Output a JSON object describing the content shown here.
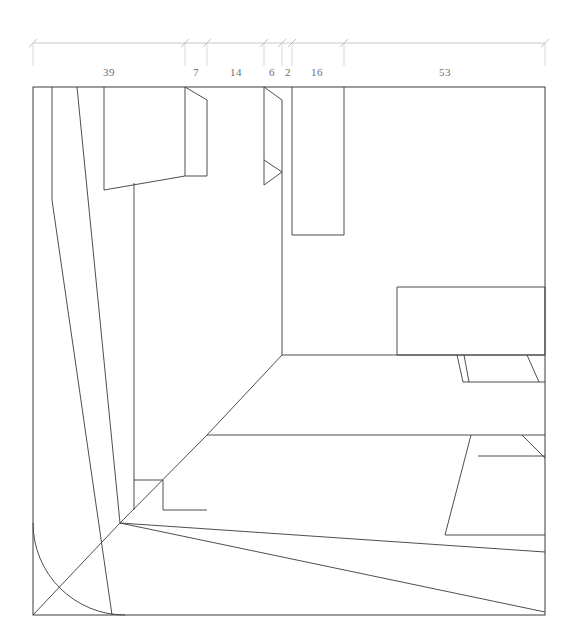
{
  "figure": {
    "background_color": "#ffffff",
    "line_color": "#3a3a3a",
    "dimension_color": "#b9b9b9",
    "dimension_text_color": "#6d6d6d"
  },
  "dimension_string": {
    "name": "top-dimension-chain",
    "baseline_y": 43,
    "label_y": 76,
    "start_x": 33,
    "end_x": 545,
    "ticks": [
      33,
      185,
      207,
      264,
      282,
      292,
      344,
      545
    ],
    "segments": [
      {
        "label": "39",
        "from_x": 33,
        "to_x": 185,
        "center_x": 109
      },
      {
        "label": "7",
        "from_x": 185,
        "to_x": 207,
        "center_x": 196
      },
      {
        "label": "14",
        "from_x": 207,
        "to_x": 264,
        "center_x": 236
      },
      {
        "label": "6",
        "from_x": 264,
        "to_x": 282,
        "center_x": 272
      },
      {
        "label": "2",
        "from_x": 282,
        "to_x": 292,
        "center_x": 288
      },
      {
        "label": "16",
        "from_x": 292,
        "to_x": 344,
        "center_x": 317
      },
      {
        "label": "53",
        "from_x": 344,
        "to_x": 545,
        "center_x": 445
      }
    ],
    "extension_lines": [
      {
        "x": 33,
        "y1": 43,
        "y2": 66
      },
      {
        "x": 185,
        "y1": 43,
        "y2": 66
      },
      {
        "x": 207,
        "y1": 43,
        "y2": 66
      },
      {
        "x": 264,
        "y1": 43,
        "y2": 66
      },
      {
        "x": 282,
        "y1": 43,
        "y2": 66
      },
      {
        "x": 292,
        "y1": 43,
        "y2": 66
      },
      {
        "x": 344,
        "y1": 43,
        "y2": 66
      },
      {
        "x": 545,
        "y1": 43,
        "y2": 66
      }
    ]
  },
  "frame": {
    "name": "drawing-frame",
    "left": 33,
    "top": 87,
    "right": 545,
    "bottom": 615
  },
  "geometry": {
    "long_diagonals": [
      {
        "name": "outer-diagonal",
        "points": "52,87 52,200 112,615"
      },
      {
        "name": "inner-diagonal",
        "points": "77,87 120,523"
      }
    ],
    "left_block": {
      "name": "left-vertical-block",
      "verticals": [
        {
          "x": 104,
          "y1": 87,
          "y2": 190
        },
        {
          "x": 134,
          "y1": 190,
          "y2": 510
        }
      ],
      "notch_polyline": "104,190 185,176"
    },
    "notch_left": {
      "name": "notch-left-upper",
      "polyline": "185,87 207,95 207,176 185,190"
    },
    "notch_right": {
      "name": "notch-right-upper",
      "polyline": "264,87 282,95 282,176 264,190"
    },
    "inner_verticals": [
      {
        "name": "vertical-185",
        "x": 185,
        "y1": 87,
        "y2": 190
      },
      {
        "name": "vertical-207",
        "x": 207,
        "y1": 95,
        "y2": 176
      },
      {
        "name": "vertical-264",
        "x": 264,
        "y1": 87,
        "y2": 190
      },
      {
        "name": "vertical-282",
        "x": 282,
        "y1": 95,
        "y2": 355
      },
      {
        "name": "vertical-292",
        "x": 292,
        "y1": 87,
        "y2": 235
      },
      {
        "name": "vertical-344",
        "x": 344,
        "y1": 87,
        "y2": 235
      },
      {
        "name": "vertical-134-lower",
        "x": 134,
        "y1": 190,
        "y2": 510
      }
    ],
    "horizontals": [
      {
        "name": "block-bottom-292-344",
        "x1": 292,
        "x2": 344,
        "y": 235
      },
      {
        "name": "ledge-282-right",
        "x1": 282,
        "x2": 545,
        "y": 355
      },
      {
        "name": "floor-207-545",
        "x1": 207,
        "x2": 545,
        "y": 435
      }
    ],
    "right_rectangle": {
      "name": "right-rectangle",
      "x1": 397,
      "y1": 287,
      "x2": 545,
      "y2": 355
    },
    "tabs_below_ledge": [
      {
        "name": "tab-left",
        "polyline": "458,355 462,383 545,383"
      },
      {
        "name": "tab-right",
        "polyline": "525,355 537,383"
      }
    ],
    "lower_right_shapes": [
      {
        "name": "lower-trapezoid-outer",
        "polyline": "471,435 445,535 545,535"
      },
      {
        "name": "lower-trapezoid-inner",
        "polyline": "478,456 545,456"
      },
      {
        "name": "lower-tab-corner",
        "polyline": "522,435 545,458"
      }
    ],
    "mid_slope": {
      "name": "mid-slope-line",
      "polyline": "282,435 207,435"
    },
    "stair_corner": {
      "name": "stair-corner",
      "polyline": "134,480 163,480 163,510 207,510"
    },
    "converge_point": {
      "x": 120,
      "y": 523
    },
    "converging_lines": [
      {
        "name": "converge-from-floor",
        "polyline": "120,523 207,435"
      },
      {
        "name": "converge-to-bottom-right-1",
        "polyline": "120,523 545,560"
      },
      {
        "name": "converge-to-bottom-right-2",
        "polyline": "120,523 545,615"
      },
      {
        "name": "converge-to-bottom-left",
        "polyline": "120,523 33,615"
      }
    ],
    "arc": {
      "name": "corner-arc",
      "path": "M 33,525 A 92,92 0 0 0 125,615"
    }
  }
}
